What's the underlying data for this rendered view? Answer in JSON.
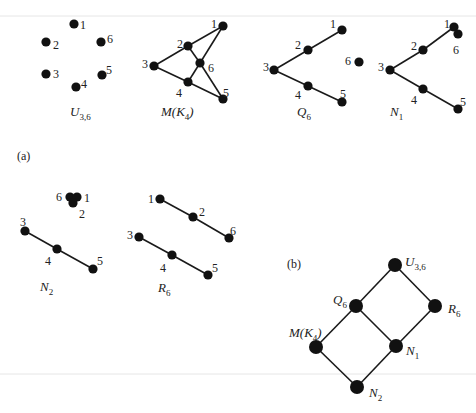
{
  "part_labels": {
    "a": "(a)",
    "b": "(b)"
  },
  "matroids": [
    {
      "id": "U36",
      "name": "U",
      "sub": "3,6",
      "name_pos": [
        70,
        116
      ],
      "points": [
        {
          "id": "1",
          "x": 74,
          "y": 24,
          "lx": 80,
          "ly": 25
        },
        {
          "id": "2",
          "x": 46,
          "y": 42,
          "lx": 53,
          "ly": 45
        },
        {
          "id": "6",
          "x": 101,
          "y": 42,
          "lx": 107,
          "ly": 39
        },
        {
          "id": "3",
          "x": 46,
          "y": 74,
          "lx": 53,
          "ly": 74
        },
        {
          "id": "5",
          "x": 102,
          "y": 75,
          "lx": 106,
          "ly": 70
        },
        {
          "id": "4",
          "x": 76,
          "y": 87,
          "lx": 81,
          "ly": 84
        }
      ],
      "edges": []
    },
    {
      "id": "MK4",
      "name": "M(K",
      "sub": "4",
      "tail": ")",
      "name_pos": [
        161,
        116
      ],
      "points": [
        {
          "id": "1",
          "x": 223,
          "y": 26,
          "lx": 211,
          "ly": 24
        },
        {
          "id": "2",
          "x": 188,
          "y": 46,
          "lx": 177,
          "ly": 44
        },
        {
          "id": "6",
          "x": 200,
          "y": 63,
          "lx": 208,
          "ly": 68
        },
        {
          "id": "3",
          "x": 154,
          "y": 66,
          "lx": 142,
          "ly": 64
        },
        {
          "id": "4",
          "x": 188,
          "y": 82,
          "lx": 176,
          "ly": 93
        },
        {
          "id": "5",
          "x": 223,
          "y": 99,
          "lx": 223,
          "ly": 93
        }
      ],
      "edges": [
        [
          "1",
          "2"
        ],
        [
          "2",
          "3"
        ],
        [
          "3",
          "4"
        ],
        [
          "4",
          "5"
        ],
        [
          "1",
          "6"
        ],
        [
          "6",
          "4"
        ],
        [
          "2",
          "6"
        ],
        [
          "6",
          "5"
        ]
      ]
    },
    {
      "id": "Q6",
      "name": "Q",
      "sub": "6",
      "name_pos": [
        297,
        116
      ],
      "points": [
        {
          "id": "1",
          "x": 342,
          "y": 30,
          "lx": 330,
          "ly": 24
        },
        {
          "id": "2",
          "x": 308,
          "y": 50,
          "lx": 295,
          "ly": 45
        },
        {
          "id": "3",
          "x": 274,
          "y": 70,
          "lx": 263,
          "ly": 67
        },
        {
          "id": "4",
          "x": 308,
          "y": 86,
          "lx": 295,
          "ly": 95
        },
        {
          "id": "5",
          "x": 342,
          "y": 102,
          "lx": 340,
          "ly": 94
        },
        {
          "id": "6",
          "x": 359,
          "y": 62,
          "lx": 345,
          "ly": 61
        }
      ],
      "edges": [
        [
          "1",
          "2"
        ],
        [
          "2",
          "3"
        ],
        [
          "3",
          "4"
        ],
        [
          "4",
          "5"
        ]
      ]
    },
    {
      "id": "N1",
      "name": "N",
      "sub": "1",
      "name_pos": [
        390,
        116
      ],
      "points": [
        {
          "id": "1",
          "x": 454,
          "y": 27,
          "lx": 444,
          "ly": 24
        },
        {
          "id": "6",
          "x": 458,
          "y": 34,
          "lx": 453,
          "ly": 50
        },
        {
          "id": "2",
          "x": 423,
          "y": 50,
          "lx": 411,
          "ly": 46
        },
        {
          "id": "3",
          "x": 390,
          "y": 70,
          "lx": 378,
          "ly": 67
        },
        {
          "id": "4",
          "x": 423,
          "y": 89,
          "lx": 411,
          "ly": 100
        },
        {
          "id": "5",
          "x": 458,
          "y": 109,
          "lx": 460,
          "ly": 102
        }
      ],
      "edges": [
        [
          "1",
          "2"
        ],
        [
          "2",
          "3"
        ],
        [
          "3",
          "4"
        ],
        [
          "4",
          "5"
        ]
      ]
    },
    {
      "id": "N2",
      "name": "N",
      "sub": "2",
      "name_pos": [
        40,
        291
      ],
      "points": [
        {
          "id": "6",
          "x": 70,
          "y": 197,
          "lx": 56,
          "ly": 197
        },
        {
          "id": "1",
          "x": 77,
          "y": 197,
          "lx": 84,
          "ly": 198
        },
        {
          "id": "2",
          "x": 73,
          "y": 203,
          "lx": 79,
          "ly": 214
        },
        {
          "id": "3",
          "x": 25,
          "y": 231,
          "lx": 20,
          "ly": 222
        },
        {
          "id": "4",
          "x": 57,
          "y": 249,
          "lx": 45,
          "ly": 261
        },
        {
          "id": "5",
          "x": 93,
          "y": 269,
          "lx": 97,
          "ly": 261
        }
      ],
      "edges": [
        [
          "3",
          "4"
        ],
        [
          "4",
          "5"
        ]
      ]
    },
    {
      "id": "R6",
      "name": "R",
      "sub": "6",
      "name_pos": [
        158,
        292
      ],
      "points": [
        {
          "id": "1",
          "x": 160,
          "y": 199,
          "lx": 148,
          "ly": 199
        },
        {
          "id": "2",
          "x": 193,
          "y": 217,
          "lx": 199,
          "ly": 212
        },
        {
          "id": "6",
          "x": 229,
          "y": 238,
          "lx": 230,
          "ly": 231
        },
        {
          "id": "3",
          "x": 139,
          "y": 237,
          "lx": 127,
          "ly": 235
        },
        {
          "id": "4",
          "x": 172,
          "y": 255,
          "lx": 160,
          "ly": 268
        },
        {
          "id": "5",
          "x": 208,
          "y": 275,
          "lx": 212,
          "ly": 268
        }
      ],
      "edges": [
        [
          "1",
          "2"
        ],
        [
          "2",
          "6"
        ],
        [
          "3",
          "4"
        ],
        [
          "4",
          "5"
        ]
      ]
    }
  ],
  "lattice": {
    "nodes": [
      {
        "id": "U36",
        "name": "U",
        "sub": "3,6",
        "x": 395,
        "y": 265,
        "lx": 405,
        "ly": 266
      },
      {
        "id": "Q6",
        "name": "Q",
        "sub": "6",
        "x": 356,
        "y": 306,
        "lx": 333,
        "ly": 304
      },
      {
        "id": "R6",
        "name": "R",
        "sub": "6",
        "x": 435,
        "y": 306,
        "lx": 448,
        "ly": 313
      },
      {
        "id": "MK4",
        "name": "M(K",
        "sub": "4",
        "tail": ")",
        "x": 316,
        "y": 347,
        "lx": 289,
        "ly": 337
      },
      {
        "id": "N1",
        "name": "N",
        "sub": "1",
        "x": 396,
        "y": 346,
        "lx": 406,
        "ly": 355
      },
      {
        "id": "N2",
        "name": "N",
        "sub": "2",
        "x": 357,
        "y": 387,
        "lx": 369,
        "ly": 397
      }
    ],
    "edges": [
      [
        "U36",
        "Q6"
      ],
      [
        "U36",
        "R6"
      ],
      [
        "Q6",
        "MK4"
      ],
      [
        "Q6",
        "N1"
      ],
      [
        "R6",
        "N1"
      ],
      [
        "MK4",
        "N2"
      ],
      [
        "N1",
        "N2"
      ]
    ]
  }
}
